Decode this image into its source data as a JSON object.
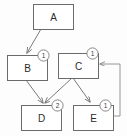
{
  "diagram": {
    "type": "node-graph",
    "title": "",
    "background_color": "#fdfdfd",
    "stroke_color": "#6b6b6b",
    "text_color": "#2b2b2b",
    "nodes": [
      {
        "id": "A",
        "label": "A",
        "badge": null,
        "x": 33,
        "y": 4,
        "w": 40,
        "h": 25
      },
      {
        "id": "B",
        "label": "B",
        "badge": "1",
        "x": 7,
        "y": 55,
        "w": 40,
        "h": 25
      },
      {
        "id": "C",
        "label": "C",
        "badge": "1",
        "x": 58,
        "y": 53,
        "w": 40,
        "h": 25
      },
      {
        "id": "D",
        "label": "D",
        "badge": "2",
        "x": 21,
        "y": 105,
        "w": 40,
        "h": 25
      },
      {
        "id": "E",
        "label": "E",
        "badge": "1",
        "x": 73,
        "y": 105,
        "w": 40,
        "h": 25
      }
    ],
    "edges": [
      {
        "from": "A",
        "to": "B",
        "kind": "arrow"
      },
      {
        "from": "B",
        "to": "D",
        "kind": "arrow"
      },
      {
        "from": "C",
        "to": "D",
        "kind": "arrow"
      },
      {
        "from": "C",
        "to": "E",
        "kind": "arrow"
      },
      {
        "from": "E",
        "to": "C",
        "kind": "arrow-feedback",
        "routing": "right-side-loop"
      }
    ]
  }
}
